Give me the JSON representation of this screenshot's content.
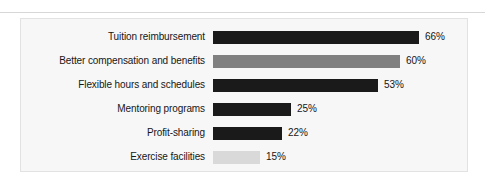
{
  "panel": {
    "background_color": "#f7f7f7",
    "border_color": "#e2e2e2"
  },
  "chart_data": {
    "type": "bar",
    "orientation": "horizontal",
    "title": "",
    "subtitle": "",
    "xlabel": "",
    "ylabel": "",
    "grid": false,
    "legend": false,
    "xlim": [
      0,
      100
    ],
    "value_suffix": "%",
    "categories": [
      "Tuition reimbursement",
      "Better compensation and benefits",
      "Flexible hours and schedules",
      "Mentoring programs",
      "Profit-sharing",
      "Exercise facilities"
    ],
    "values": [
      66,
      60,
      53,
      25,
      22,
      15
    ],
    "value_labels": [
      "66%",
      "60%",
      "53%",
      "25%",
      "22%",
      "15%"
    ],
    "bar_colors": [
      "#1a1a1a",
      "#808080",
      "#1a1a1a",
      "#1a1a1a",
      "#1a1a1a",
      "#d9d9d9"
    ],
    "bars": [
      {
        "label": "Tuition reimbursement",
        "value": 66,
        "value_label": "66%",
        "color": "#1a1a1a",
        "width_px": 206
      },
      {
        "label": "Better compensation and benefits",
        "value": 60,
        "value_label": "60%",
        "color": "#808080",
        "width_px": 187
      },
      {
        "label": "Flexible hours and schedules",
        "value": 53,
        "value_label": "53%",
        "color": "#1a1a1a",
        "width_px": 165
      },
      {
        "label": "Mentoring programs",
        "value": 25,
        "value_label": "25%",
        "color": "#1a1a1a",
        "width_px": 78
      },
      {
        "label": "Profit-sharing",
        "value": 22,
        "value_label": "22%",
        "color": "#1a1a1a",
        "width_px": 69
      },
      {
        "label": "Exercise facilities",
        "value": 15,
        "value_label": "15%",
        "color": "#d9d9d9",
        "width_px": 47
      }
    ]
  }
}
